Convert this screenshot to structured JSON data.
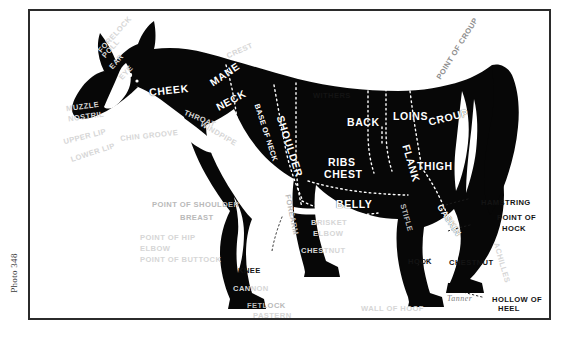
{
  "page": {
    "photo_caption": "Photo 348",
    "signature": "Tanner"
  },
  "colors": {
    "ink": "#1d1d1d",
    "body_fill": "#0a0a0a",
    "ground": "#ffffff",
    "frame": "#2b2b2b",
    "label_light": "#b9b9b9",
    "label_dark": "#141414"
  },
  "diagram": {
    "type": "anatomy-points-chart",
    "body_labels": [
      {
        "text": "CHEEK",
        "x": 119,
        "y": 74,
        "rot": -6,
        "size": "md"
      },
      {
        "text": "MANE",
        "x": 178,
        "y": 58,
        "rot": -34,
        "size": "md"
      },
      {
        "text": "NECK",
        "x": 185,
        "y": 84,
        "rot": -28,
        "size": "md"
      },
      {
        "text": "SHOULDER",
        "x": 228,
        "y": 130,
        "rot": 72,
        "size": "md"
      },
      {
        "text": "BASE OF NECK",
        "x": 206,
        "y": 118,
        "rot": 72,
        "size": "xs"
      },
      {
        "text": "BACK",
        "x": 317,
        "y": 106,
        "rot": 0,
        "size": "md"
      },
      {
        "text": "LOINS",
        "x": 363,
        "y": 100,
        "rot": 0,
        "size": "md"
      },
      {
        "text": "CROUP",
        "x": 398,
        "y": 101,
        "rot": -14,
        "size": "md"
      },
      {
        "text": "RIBS",
        "x": 298,
        "y": 146,
        "rot": 0,
        "size": "md"
      },
      {
        "text": "CHEST",
        "x": 294,
        "y": 158,
        "rot": 0,
        "size": "md"
      },
      {
        "text": "FLANK",
        "x": 362,
        "y": 147,
        "rot": 74,
        "size": "md"
      },
      {
        "text": "THIGH",
        "x": 387,
        "y": 150,
        "rot": 0,
        "size": "md"
      },
      {
        "text": "BELLY",
        "x": 306,
        "y": 188,
        "rot": 0,
        "size": "md"
      },
      {
        "text": "GASKIN",
        "x": 401,
        "y": 205,
        "rot": 56,
        "size": "sm"
      }
    ],
    "ground_labels": [
      {
        "text": "FORELOCK",
        "x": 62,
        "y": 20,
        "rot": -48,
        "tone": "vfaint"
      },
      {
        "text": "POLL",
        "x": 70,
        "y": 34,
        "rot": -48,
        "tone": "vfaint"
      },
      {
        "text": "EAR",
        "x": 78,
        "y": 47,
        "rot": -48,
        "tone": "vfaint"
      },
      {
        "text": "EYE",
        "x": 88,
        "y": 58,
        "rot": -48,
        "tone": "vfaint"
      },
      {
        "text": "CREST",
        "x": 196,
        "y": 36,
        "rot": -24,
        "tone": "vfaint"
      },
      {
        "text": "POINT OF CROUP",
        "x": 392,
        "y": 34,
        "rot": -58,
        "tone": "mid"
      },
      {
        "text": "WITHERS",
        "x": 283,
        "y": 81,
        "rot": 0,
        "tone": "dark"
      },
      {
        "text": "THROAT",
        "x": 153,
        "y": 104,
        "rot": 22,
        "tone": "vfaint"
      },
      {
        "text": "WINDPIPE",
        "x": 168,
        "y": 119,
        "rot": 30,
        "tone": "vfaint"
      },
      {
        "text": "MUZZLE",
        "x": 36,
        "y": 92,
        "rot": -8,
        "tone": "vfaint"
      },
      {
        "text": "NOSTRIL",
        "x": 38,
        "y": 102,
        "rot": -8,
        "tone": "vfaint"
      },
      {
        "text": "UPPER LIP",
        "x": 33,
        "y": 122,
        "rot": -14,
        "tone": "vfaint"
      },
      {
        "text": "CHIN GROOVE",
        "x": 90,
        "y": 121,
        "rot": -6,
        "tone": "vfaint"
      },
      {
        "text": "LOWER LIP",
        "x": 40,
        "y": 138,
        "rot": -18,
        "tone": "vfaint"
      },
      {
        "text": "POINT OF SHOULDER",
        "x": 122,
        "y": 190,
        "rot": 0,
        "tone": "faint"
      },
      {
        "text": "BREAST",
        "x": 150,
        "y": 203,
        "rot": 0,
        "tone": "faint"
      },
      {
        "text": "POINT OF HIP",
        "x": 110,
        "y": 223,
        "rot": 0,
        "tone": "vfaint"
      },
      {
        "text": "ELBOW",
        "x": 110,
        "y": 234,
        "rot": 0,
        "tone": "vfaint"
      },
      {
        "text": "POINT OF BUTTOCK",
        "x": 110,
        "y": 245,
        "rot": 0,
        "tone": "vfaint"
      },
      {
        "text": "FOREARM",
        "x": 241,
        "y": 200,
        "rot": 78,
        "tone": "faint"
      },
      {
        "text": "BRISKET",
        "x": 281,
        "y": 208,
        "rot": 0,
        "tone": "vfaint"
      },
      {
        "text": "ELBOW",
        "x": 283,
        "y": 219,
        "rot": 0,
        "tone": "vfaint"
      },
      {
        "text": "CHESTNUT",
        "x": 271,
        "y": 236,
        "rot": 0,
        "tone": "vfaint"
      },
      {
        "text": "KNEE",
        "x": 208,
        "y": 256,
        "rot": 0,
        "tone": "dark"
      },
      {
        "text": "CANNON",
        "x": 203,
        "y": 274,
        "rot": 0,
        "tone": "vfaint"
      },
      {
        "text": "FETLOCK",
        "x": 217,
        "y": 291,
        "rot": 0,
        "tone": "faint"
      },
      {
        "text": "PASTERN",
        "x": 223,
        "y": 301,
        "rot": 0,
        "tone": "vfaint"
      },
      {
        "text": "CORONET",
        "x": 196,
        "y": 311,
        "rot": 0,
        "tone": "vfaint"
      },
      {
        "text": "STIFLE",
        "x": 362,
        "y": 203,
        "rot": 74,
        "tone": "faint"
      },
      {
        "text": "HAMSTRING",
        "x": 451,
        "y": 188,
        "rot": 0,
        "tone": "dark"
      },
      {
        "text": "POINT OF",
        "x": 467,
        "y": 203,
        "rot": 0,
        "tone": "dark"
      },
      {
        "text": "HOCK",
        "x": 472,
        "y": 214,
        "rot": 0,
        "tone": "dark"
      },
      {
        "text": "HOCK",
        "x": 378,
        "y": 247,
        "rot": 0,
        "tone": "dark"
      },
      {
        "text": "CHESTNUT",
        "x": 419,
        "y": 248,
        "rot": 0,
        "tone": "dark"
      },
      {
        "text": "ACHILLES",
        "x": 451,
        "y": 248,
        "rot": 74,
        "tone": "vfaint"
      },
      {
        "text": "HOLLOW OF",
        "x": 462,
        "y": 285,
        "rot": 0,
        "tone": "dark"
      },
      {
        "text": "HEEL",
        "x": 468,
        "y": 294,
        "rot": 0,
        "tone": "dark"
      },
      {
        "text": "WALL OF HOOF",
        "x": 331,
        "y": 294,
        "rot": 0,
        "tone": "vfaint"
      }
    ]
  }
}
